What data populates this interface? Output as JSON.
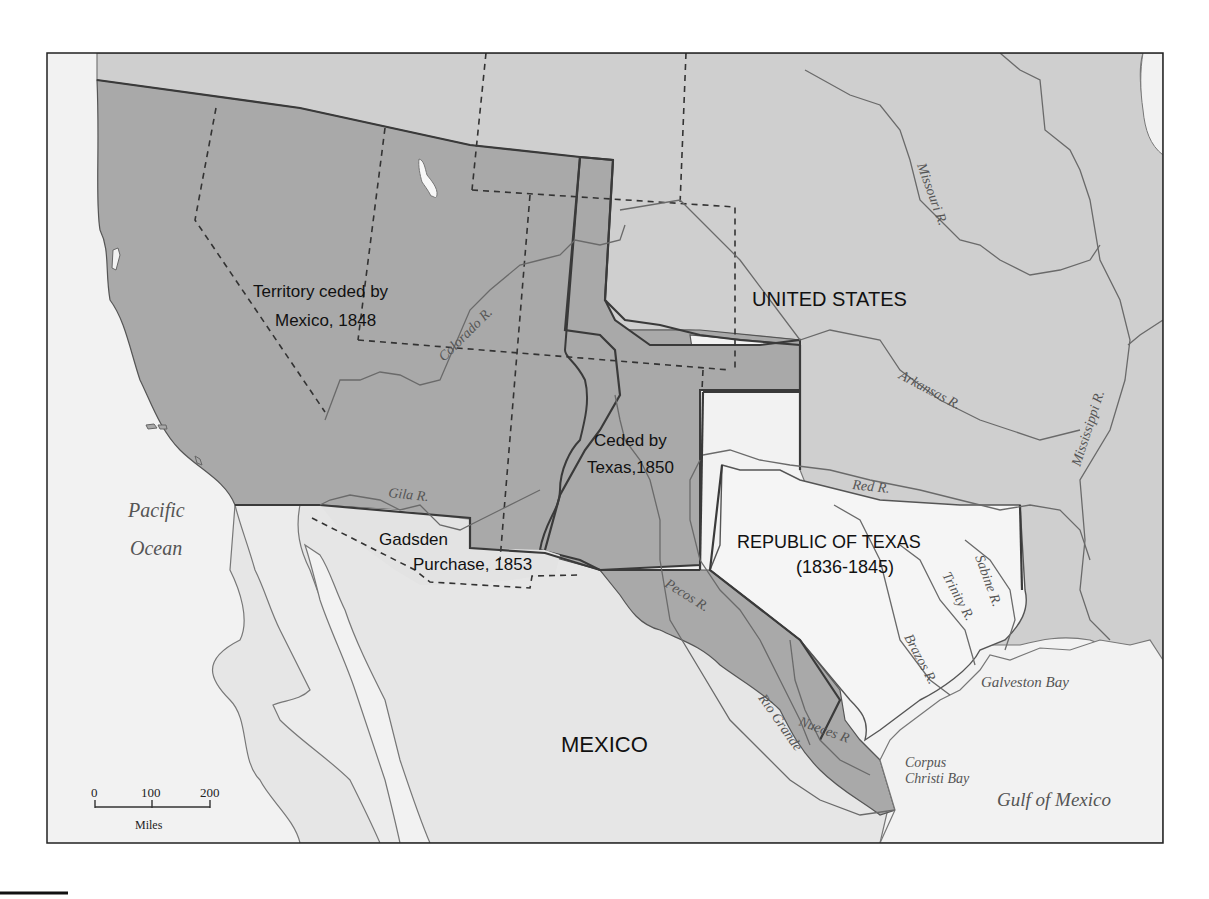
{
  "map": {
    "colors": {
      "water": "#f2f2f2",
      "land_us": "#cfcfcf",
      "land_mexico": "#e6e6e6",
      "ceded_territory": "#a9a9a9",
      "republic_of_texas": "#f5f5f5",
      "frame": "#222222"
    },
    "regions": {
      "territory_ceded": {
        "line1": "Territory ceded by",
        "line2": "Mexico, 1848"
      },
      "ceded_by_texas": {
        "line1": "Ceded by",
        "line2": "Texas,1850"
      },
      "gadsden": {
        "line1": "Gadsden",
        "line2": "Purchase, 1853"
      },
      "united_states": "UNITED STATES",
      "republic_of_texas": {
        "line1": "REPUBLIC OF TEXAS",
        "line2": "(1836-1845)"
      },
      "mexico": "MEXICO"
    },
    "water_bodies": {
      "pacific": {
        "line1": "Pacific",
        "line2": "Ocean"
      },
      "gulf": "Gulf of Mexico",
      "galveston": "Galveston Bay",
      "corpus": {
        "line1": "Corpus",
        "line2": "Christi Bay"
      }
    },
    "rivers": {
      "colorado": "Colorado R.",
      "missouri": "Missouri R.",
      "arkansas": "Arkansas R.",
      "mississippi": "Mississippi R.",
      "red": "Red R.",
      "gila": "Gila R.",
      "pecos": "Pecos R.",
      "rio_grande": "Rio Grande",
      "nueces": "Nueces R",
      "brazos": "Brazos R.",
      "trinity": "Trinity R.",
      "sabine": "Sabine R."
    },
    "scale_bar": {
      "ticks": [
        "0",
        "100",
        "200"
      ],
      "unit": "Miles"
    }
  }
}
